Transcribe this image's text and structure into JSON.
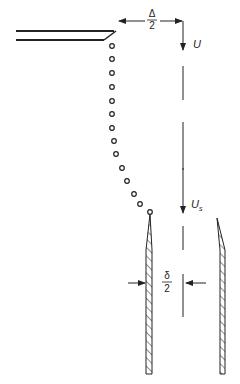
{
  "diagram": {
    "labels": {
      "half_gap_top_num": "Δ",
      "half_gap_top_den": "2",
      "velocity_upstream": "U",
      "velocity_upstream_sub": "",
      "velocity_downstream": "U",
      "velocity_downstream_sub": "s",
      "half_gap_bottom_num": "δ",
      "half_gap_bottom_den": "2"
    },
    "colors": {
      "stroke": "#222222",
      "background": "#ffffff"
    },
    "streamline_points": [
      [
        112,
        46
      ],
      [
        112,
        59
      ],
      [
        112,
        73
      ],
      [
        112,
        87
      ],
      [
        112,
        101
      ],
      [
        112,
        114
      ],
      [
        112,
        128
      ],
      [
        114,
        141
      ],
      [
        116,
        154
      ],
      [
        122,
        168
      ],
      [
        127,
        181
      ],
      [
        134,
        194
      ],
      [
        140,
        204
      ],
      [
        150,
        212
      ]
    ]
  }
}
